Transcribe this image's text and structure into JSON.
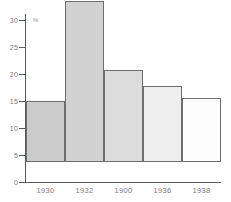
{
  "chart_data": {
    "type": "bar",
    "title": "",
    "xlabel": "",
    "ylabel": "%",
    "categories": [
      "1930",
      "1932",
      "1900",
      "1936",
      "1938"
    ],
    "values": [
      11.3,
      29.8,
      17.0,
      14.0,
      11.8
    ],
    "ylim": [
      0,
      30
    ],
    "yticks": [
      0,
      5,
      10,
      15,
      20,
      25,
      30
    ],
    "ytick_labels": [
      "0",
      "5",
      "10",
      "15",
      "20",
      "25",
      "30"
    ],
    "grid": false,
    "legend": null,
    "bar_colors": [
      "#cccccc",
      "#d2d2d2",
      "#dcdcdc",
      "#eeeeee",
      "#fdfdfd"
    ],
    "bar_border_color": "#6e6e6e",
    "axis_color": "#5a5a5a",
    "background": "#ffffff"
  },
  "axis": {
    "unit_symbol": "%"
  }
}
